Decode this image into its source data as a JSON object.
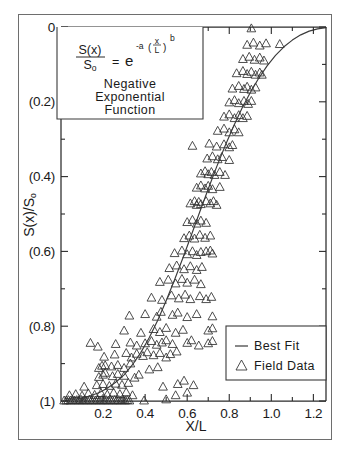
{
  "chart_data": {
    "type": "scatter",
    "title": "",
    "xlabel": "X/L",
    "ylabel": "S(x)/S₀",
    "xlim": [
      0,
      1.26
    ],
    "ylim": [
      0,
      1
    ],
    "y_axis_inverted": true,
    "grid": false,
    "xticks": [
      0.2,
      0.4,
      0.6,
      0.8,
      1.0,
      1.2
    ],
    "xtick_labels": [
      "0.2",
      "0.4",
      "0.6",
      "0.8",
      "1.0",
      "1.2"
    ],
    "xminor_ticks": [
      0.1,
      0.3,
      0.5,
      0.7,
      0.9,
      1.1
    ],
    "yticks": [
      0,
      0.2,
      0.4,
      0.6,
      0.8,
      1.0
    ],
    "ytick_labels": [
      "0",
      "(0.2)",
      "(0.4)",
      "(0.6)",
      "(0.8)",
      "(1)"
    ],
    "yminor_ticks": [
      0.1,
      0.3,
      0.5,
      0.7,
      0.9
    ],
    "legend_position": "lower-right",
    "series": [
      {
        "name": "Best Fit",
        "type": "line",
        "marker": "line",
        "equation": "S(x)/So = exp(-a*(x/L)^b)",
        "points": [
          [
            0.02,
            0.998
          ],
          [
            0.06,
            0.996
          ],
          [
            0.1,
            0.992
          ],
          [
            0.14,
            0.986
          ],
          [
            0.18,
            0.978
          ],
          [
            0.22,
            0.966
          ],
          [
            0.26,
            0.95
          ],
          [
            0.3,
            0.93
          ],
          [
            0.34,
            0.903
          ],
          [
            0.38,
            0.87
          ],
          [
            0.42,
            0.83
          ],
          [
            0.46,
            0.784
          ],
          [
            0.5,
            0.732
          ],
          [
            0.54,
            0.676
          ],
          [
            0.58,
            0.617
          ],
          [
            0.62,
            0.556
          ],
          [
            0.66,
            0.494
          ],
          [
            0.7,
            0.433
          ],
          [
            0.74,
            0.374
          ],
          [
            0.78,
            0.318
          ],
          [
            0.82,
            0.266
          ],
          [
            0.86,
            0.218
          ],
          [
            0.9,
            0.175
          ],
          [
            0.94,
            0.137
          ],
          [
            0.98,
            0.104
          ],
          [
            1.02,
            0.076
          ],
          [
            1.06,
            0.053
          ],
          [
            1.1,
            0.035
          ],
          [
            1.14,
            0.021
          ],
          [
            1.18,
            0.011
          ],
          [
            1.22,
            0.005
          ],
          [
            1.26,
            0.002
          ]
        ]
      },
      {
        "name": "Field Data",
        "type": "scatter",
        "marker": "triangle-up",
        "points": [
          [
            0.015,
            0.999
          ],
          [
            0.025,
            0.999
          ],
          [
            0.035,
            0.998
          ],
          [
            0.045,
            0.999
          ],
          [
            0.055,
            0.997
          ],
          [
            0.065,
            0.999
          ],
          [
            0.075,
            0.998
          ],
          [
            0.085,
            0.999
          ],
          [
            0.095,
            0.997
          ],
          [
            0.105,
            0.999
          ],
          [
            0.115,
            0.998
          ],
          [
            0.125,
            0.999
          ],
          [
            0.135,
            0.997
          ],
          [
            0.145,
            0.999
          ],
          [
            0.155,
            0.998
          ],
          [
            0.165,
            0.999
          ],
          [
            0.175,
            0.997
          ],
          [
            0.185,
            0.999
          ],
          [
            0.195,
            0.998
          ],
          [
            0.205,
            0.999
          ],
          [
            0.215,
            0.998
          ],
          [
            0.225,
            0.999
          ],
          [
            0.235,
            0.997
          ],
          [
            0.245,
            0.999
          ],
          [
            0.255,
            0.998
          ],
          [
            0.265,
            0.999
          ],
          [
            0.275,
            0.998
          ],
          [
            0.285,
            0.999
          ],
          [
            0.295,
            0.997
          ],
          [
            0.305,
            0.999
          ],
          [
            0.315,
            0.998
          ],
          [
            0.325,
            0.999
          ],
          [
            0.04,
            0.985
          ],
          [
            0.07,
            0.982
          ],
          [
            0.1,
            0.986
          ],
          [
            0.13,
            0.98
          ],
          [
            0.16,
            0.984
          ],
          [
            0.19,
            0.979
          ],
          [
            0.22,
            0.983
          ],
          [
            0.25,
            0.978
          ],
          [
            0.28,
            0.982
          ],
          [
            0.31,
            0.977
          ],
          [
            0.34,
            0.985
          ],
          [
            0.11,
            0.962
          ],
          [
            0.17,
            0.958
          ],
          [
            0.2,
            0.955
          ],
          [
            0.23,
            0.96
          ],
          [
            0.26,
            0.954
          ],
          [
            0.29,
            0.957
          ],
          [
            0.32,
            0.952
          ],
          [
            0.18,
            0.936
          ],
          [
            0.2,
            0.93
          ],
          [
            0.21,
            0.925
          ],
          [
            0.245,
            0.934
          ],
          [
            0.27,
            0.928
          ],
          [
            0.3,
            0.933
          ],
          [
            0.35,
            0.938
          ],
          [
            0.37,
            0.93
          ],
          [
            0.18,
            0.912
          ],
          [
            0.195,
            0.906
          ],
          [
            0.24,
            0.908
          ],
          [
            0.27,
            0.904
          ],
          [
            0.3,
            0.912
          ],
          [
            0.33,
            0.9
          ],
          [
            0.42,
            0.916
          ],
          [
            0.46,
            0.91
          ],
          [
            0.205,
            0.882
          ],
          [
            0.255,
            0.876
          ],
          [
            0.31,
            0.872
          ],
          [
            0.335,
            0.884
          ],
          [
            0.36,
            0.874
          ],
          [
            0.39,
            0.88
          ],
          [
            0.41,
            0.87
          ],
          [
            0.44,
            0.878
          ],
          [
            0.47,
            0.872
          ],
          [
            0.5,
            0.884
          ],
          [
            0.52,
            0.875
          ],
          [
            0.55,
            0.868
          ],
          [
            0.14,
            0.845
          ],
          [
            0.26,
            0.848
          ],
          [
            0.33,
            0.844
          ],
          [
            0.36,
            0.852
          ],
          [
            0.4,
            0.846
          ],
          [
            0.43,
            0.84
          ],
          [
            0.455,
            0.85
          ],
          [
            0.48,
            0.844
          ],
          [
            0.5,
            0.838
          ],
          [
            0.53,
            0.848
          ],
          [
            0.6,
            0.845
          ],
          [
            0.62,
            0.838
          ],
          [
            0.655,
            0.852
          ],
          [
            0.7,
            0.846
          ],
          [
            0.72,
            0.84
          ],
          [
            0.3,
            0.812
          ],
          [
            0.38,
            0.818
          ],
          [
            0.44,
            0.808
          ],
          [
            0.47,
            0.816
          ],
          [
            0.5,
            0.805
          ],
          [
            0.545,
            0.818
          ],
          [
            0.58,
            0.81
          ],
          [
            0.7,
            0.812
          ],
          [
            0.72,
            0.806
          ],
          [
            0.325,
            0.772
          ],
          [
            0.4,
            0.768
          ],
          [
            0.455,
            0.775
          ],
          [
            0.475,
            0.762
          ],
          [
            0.53,
            0.77
          ],
          [
            0.555,
            0.764
          ],
          [
            0.6,
            0.776
          ],
          [
            0.645,
            0.768
          ],
          [
            0.72,
            0.774
          ],
          [
            0.43,
            0.724
          ],
          [
            0.48,
            0.73
          ],
          [
            0.525,
            0.718
          ],
          [
            0.56,
            0.726
          ],
          [
            0.59,
            0.716
          ],
          [
            0.615,
            0.728
          ],
          [
            0.66,
            0.72
          ],
          [
            0.69,
            0.728
          ],
          [
            0.715,
            0.722
          ],
          [
            0.47,
            0.682
          ],
          [
            0.51,
            0.676
          ],
          [
            0.545,
            0.686
          ],
          [
            0.575,
            0.674
          ],
          [
            0.6,
            0.684
          ],
          [
            0.635,
            0.676
          ],
          [
            0.665,
            0.688
          ],
          [
            0.515,
            0.645
          ],
          [
            0.55,
            0.638
          ],
          [
            0.585,
            0.648
          ],
          [
            0.615,
            0.64
          ],
          [
            0.645,
            0.65
          ],
          [
            0.67,
            0.642
          ],
          [
            0.54,
            0.605
          ],
          [
            0.575,
            0.598
          ],
          [
            0.6,
            0.608
          ],
          [
            0.625,
            0.6
          ],
          [
            0.645,
            0.61
          ],
          [
            0.665,
            0.602
          ],
          [
            0.69,
            0.6
          ],
          [
            0.71,
            0.598
          ],
          [
            0.72,
            0.606
          ],
          [
            0.585,
            0.565
          ],
          [
            0.61,
            0.558
          ],
          [
            0.635,
            0.566
          ],
          [
            0.66,
            0.556
          ],
          [
            0.685,
            0.564
          ],
          [
            0.71,
            0.558
          ],
          [
            0.6,
            0.522
          ],
          [
            0.625,
            0.516
          ],
          [
            0.645,
            0.526
          ],
          [
            0.665,
            0.518
          ],
          [
            0.69,
            0.524
          ],
          [
            0.615,
            0.472
          ],
          [
            0.635,
            0.466
          ],
          [
            0.645,
            0.476
          ],
          [
            0.655,
            0.468
          ],
          [
            0.665,
            0.474
          ],
          [
            0.69,
            0.466
          ],
          [
            0.71,
            0.472
          ],
          [
            0.725,
            0.466
          ],
          [
            0.74,
            0.476
          ],
          [
            0.645,
            0.43
          ],
          [
            0.665,
            0.424
          ],
          [
            0.685,
            0.432
          ],
          [
            0.7,
            0.425
          ],
          [
            0.72,
            0.434
          ],
          [
            0.755,
            0.428
          ],
          [
            0.665,
            0.392
          ],
          [
            0.685,
            0.386
          ],
          [
            0.7,
            0.394
          ],
          [
            0.715,
            0.388
          ],
          [
            0.73,
            0.396
          ],
          [
            0.755,
            0.388
          ],
          [
            0.78,
            0.396
          ],
          [
            0.695,
            0.352
          ],
          [
            0.72,
            0.346
          ],
          [
            0.745,
            0.354
          ],
          [
            0.765,
            0.348
          ],
          [
            0.8,
            0.356
          ],
          [
            0.625,
            0.318
          ],
          [
            0.705,
            0.312
          ],
          [
            0.74,
            0.32
          ],
          [
            0.775,
            0.314
          ],
          [
            0.8,
            0.322
          ],
          [
            0.815,
            0.316
          ],
          [
            0.745,
            0.278
          ],
          [
            0.775,
            0.272
          ],
          [
            0.8,
            0.282
          ],
          [
            0.825,
            0.274
          ],
          [
            0.845,
            0.282
          ],
          [
            0.775,
            0.24
          ],
          [
            0.8,
            0.234
          ],
          [
            0.825,
            0.244
          ],
          [
            0.845,
            0.236
          ],
          [
            0.865,
            0.244
          ],
          [
            0.885,
            0.238
          ],
          [
            0.8,
            0.202
          ],
          [
            0.825,
            0.196
          ],
          [
            0.845,
            0.204
          ],
          [
            0.87,
            0.198
          ],
          [
            0.89,
            0.206
          ],
          [
            0.905,
            0.198
          ],
          [
            0.815,
            0.165
          ],
          [
            0.845,
            0.158
          ],
          [
            0.87,
            0.166
          ],
          [
            0.885,
            0.16
          ],
          [
            0.905,
            0.168
          ],
          [
            0.925,
            0.162
          ],
          [
            0.835,
            0.124
          ],
          [
            0.865,
            0.118
          ],
          [
            0.885,
            0.126
          ],
          [
            0.905,
            0.12
          ],
          [
            0.925,
            0.128
          ],
          [
            0.945,
            0.122
          ],
          [
            0.955,
            0.128
          ],
          [
            0.865,
            0.086
          ],
          [
            0.895,
            0.08
          ],
          [
            0.92,
            0.088
          ],
          [
            0.945,
            0.082
          ],
          [
            0.965,
            0.09
          ],
          [
            0.885,
            0.048
          ],
          [
            0.915,
            0.042
          ],
          [
            0.945,
            0.05
          ],
          [
            0.975,
            0.044
          ],
          [
            1.04,
            0.046
          ],
          [
            0.905,
            0.004
          ],
          [
            0.175,
            0.855
          ],
          [
            0.21,
            0.905
          ],
          [
            0.395,
            0.999
          ],
          [
            0.5,
            0.996
          ],
          [
            0.545,
            0.985
          ],
          [
            0.6,
            0.978
          ],
          [
            0.485,
            0.962
          ],
          [
            0.555,
            0.955
          ],
          [
            0.585,
            0.946
          ],
          [
            0.63,
            0.958
          ]
        ]
      }
    ],
    "annotations": [
      {
        "name": "equation-box",
        "lines": [
          "Negative",
          "Exponential",
          "Function"
        ],
        "equation_numerator": "S(x)",
        "equation_denominator": "So",
        "equation_equals": "=",
        "equation_base": "e",
        "equation_exp_coef": "-a",
        "equation_exp_num": "x",
        "equation_exp_den": "L",
        "equation_exp_power": "b"
      }
    ]
  },
  "legend": {
    "items": [
      {
        "label": "Best Fit",
        "marker": "line"
      },
      {
        "label": "Field Data",
        "marker": "triangle"
      }
    ]
  },
  "colors": {
    "axis": "#2b2b2b",
    "line": "#3a3a3a",
    "marker": "#2e2e2e",
    "frame": "#6e6e6e",
    "background": "#ffffff"
  }
}
